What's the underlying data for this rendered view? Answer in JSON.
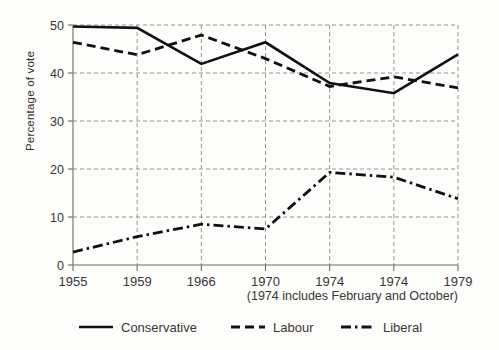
{
  "chart_data": {
    "type": "line",
    "title": "",
    "xlabel": "",
    "ylabel": "Percentage of vote",
    "categories": [
      "1955",
      "1959",
      "1966",
      "1970",
      "1974",
      "1974",
      "1979"
    ],
    "ylim": [
      0,
      50
    ],
    "xlim_index": [
      0,
      6
    ],
    "yticks": [
      0,
      10,
      20,
      30,
      40,
      50
    ],
    "ytick_labels": [
      "0",
      "10",
      "20",
      "30",
      "40",
      "50"
    ],
    "grid": "horizontal-and-vertical-dashed",
    "legend_position": "bottom-center",
    "note": "(1974 includes February and October)",
    "series": [
      {
        "name": "Conservative",
        "line_style": "solid",
        "values": [
          49.7,
          49.4,
          41.9,
          46.4,
          37.9,
          35.8,
          43.9
        ]
      },
      {
        "name": "Labour",
        "line_style": "dashed",
        "values": [
          46.4,
          43.8,
          47.9,
          43.0,
          37.2,
          39.2,
          36.9
        ]
      },
      {
        "name": "Liberal",
        "line_style": "dash-dot",
        "values": [
          2.7,
          5.9,
          8.5,
          7.5,
          19.3,
          18.3,
          13.8
        ]
      }
    ],
    "colors": {
      "series_line": "#111111",
      "grid": "#8e8b88",
      "axis": "#6f6c69",
      "background": "#fdfdfb",
      "text": "#3a3735"
    }
  },
  "legend": {
    "items": [
      {
        "label": "Conservative",
        "style": "solid"
      },
      {
        "label": "Labour",
        "style": "dashed"
      },
      {
        "label": "Liberal",
        "style": "dash-dot"
      }
    ]
  }
}
